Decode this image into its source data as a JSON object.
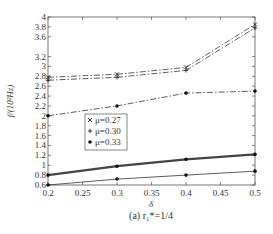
{
  "chart_data": {
    "type": "line",
    "title": "",
    "xlabel": "δ",
    "ylabel": "f/(10²Hz)",
    "caption": "(a) r₁*=1/4",
    "x": [
      0.2,
      0.3,
      0.4,
      0.5
    ],
    "xlim": [
      0.2,
      0.5
    ],
    "ylim": [
      0.6,
      4
    ],
    "xticks": [
      "0.2",
      "0.25",
      "0.3",
      "0.35",
      "0.4",
      "0.45",
      "0.5"
    ],
    "yticks": [
      "0.6",
      "0.8",
      "1",
      "1.2",
      "1.4",
      "1.6",
      "1.8",
      "2",
      "2.2",
      "2.4",
      "2.6",
      "2.8",
      "3",
      "3.2",
      "3.6",
      "3.8",
      "4"
    ],
    "grid": false,
    "legend_position": "center-left",
    "series": [
      {
        "name": "μ=0.27",
        "marker": "×",
        "style": "dash-dot",
        "values": [
          2.78,
          2.84,
          2.98,
          3.85
        ]
      },
      {
        "name": "μ=0.30",
        "marker": "+",
        "style": "dash-dot",
        "values": [
          2.72,
          2.78,
          2.92,
          3.78
        ]
      },
      {
        "name": "μ=0.33",
        "marker": "•",
        "style": "dash-dot",
        "values": [
          2.0,
          2.2,
          2.46,
          2.5
        ]
      },
      {
        "name": "",
        "marker": "•",
        "style": "solid-bold",
        "values": [
          0.8,
          0.98,
          1.12,
          1.22
        ]
      },
      {
        "name": "",
        "marker": "•",
        "style": "solid",
        "values": [
          0.6,
          0.72,
          0.8,
          0.88
        ]
      }
    ],
    "legend": [
      {
        "symbol": "×",
        "label": "μ=0.27"
      },
      {
        "symbol": "+",
        "label": "μ=0.30"
      },
      {
        "symbol": "•",
        "label": "μ=0.33"
      }
    ]
  },
  "colors": {
    "axis": "#555555",
    "line": "#333333",
    "bold_line": "#444444"
  }
}
